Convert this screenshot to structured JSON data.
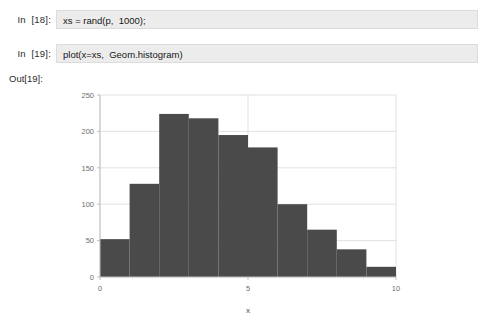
{
  "notebook": {
    "cells": [
      {
        "prompt": "In  [18]:",
        "source": "xs = rand(p,  1000);"
      },
      {
        "prompt": "In  [19]:",
        "source": "plot(x=xs,  Geom.histogram)"
      }
    ],
    "output_prompt": "Out[19]:"
  },
  "colors": {
    "bar_fill": "#4a4a4a",
    "grid": "#d9d9d9",
    "axis": "#bfbfbf",
    "cell_bg": "#ececec",
    "cell_border": "#dcdcdc",
    "tick_text": "#6e6e6e"
  },
  "chart_data": {
    "type": "bar",
    "title": "",
    "xlabel": "x",
    "ylabel": "",
    "xlim": [
      0,
      10
    ],
    "ylim": [
      0,
      250
    ],
    "xticks": [
      0,
      5,
      10
    ],
    "xtick_labels": [
      "0",
      "5",
      "10"
    ],
    "yticks": [
      0,
      50,
      100,
      150,
      200,
      250
    ],
    "ytick_labels": [
      "0",
      "50",
      "100",
      "150",
      "200",
      "250"
    ],
    "grid": true,
    "legend": "none",
    "bin_width": 1,
    "bin_edges": [
      0,
      1,
      2,
      3,
      4,
      5,
      6,
      7,
      8,
      9,
      10
    ],
    "categories": [
      "0-1",
      "1-2",
      "2-3",
      "3-4",
      "4-5",
      "5-6",
      "6-7",
      "7-8",
      "8-9",
      "9-10"
    ],
    "values": [
      52,
      128,
      224,
      218,
      195,
      178,
      100,
      65,
      38,
      14
    ],
    "bars": [
      {
        "x0": 0,
        "x1": 1,
        "value": 52
      },
      {
        "x0": 1,
        "x1": 2,
        "value": 128
      },
      {
        "x0": 2,
        "x1": 3,
        "value": 224
      },
      {
        "x0": 3,
        "x1": 4,
        "value": 218
      },
      {
        "x0": 4,
        "x1": 5,
        "value": 195
      },
      {
        "x0": 5,
        "x1": 6,
        "value": 178
      },
      {
        "x0": 6,
        "x1": 7,
        "value": 100
      },
      {
        "x0": 7,
        "x1": 8,
        "value": 65
      },
      {
        "x0": 8,
        "x1": 9,
        "value": 38
      },
      {
        "x0": 9,
        "x1": 10,
        "value": 14
      }
    ]
  }
}
